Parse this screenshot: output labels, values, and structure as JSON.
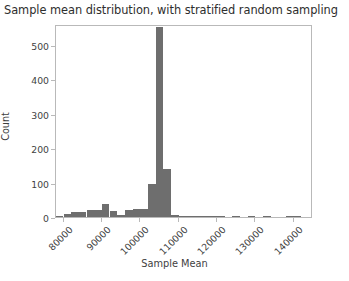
{
  "chart_data": {
    "type": "bar",
    "title": "Sample mean distribution, with stratified random sampling",
    "xlabel": "Sample Mean",
    "ylabel": "Count",
    "xlim": [
      78000,
      145000
    ],
    "ylim": [
      0,
      560
    ],
    "grid": false,
    "legend": null,
    "bar_color": "#6e6e6e",
    "bin_width": 2000,
    "xticks": [
      80000,
      90000,
      100000,
      110000,
      120000,
      130000,
      140000
    ],
    "xtick_labels": [
      "80000",
      "90000",
      "100000",
      "110000",
      "120000",
      "130000",
      "140000"
    ],
    "yticks": [
      0,
      100,
      200,
      300,
      400,
      500
    ],
    "ytick_labels": [
      "0",
      "100",
      "200",
      "300",
      "400",
      "500"
    ],
    "bins": [
      {
        "x": 78000,
        "value": 4
      },
      {
        "x": 80000,
        "value": 9
      },
      {
        "x": 82000,
        "value": 14
      },
      {
        "x": 84000,
        "value": 14
      },
      {
        "x": 86000,
        "value": 20
      },
      {
        "x": 88000,
        "value": 20
      },
      {
        "x": 90000,
        "value": 38
      },
      {
        "x": 92000,
        "value": 18
      },
      {
        "x": 94000,
        "value": 7
      },
      {
        "x": 96000,
        "value": 20
      },
      {
        "x": 98000,
        "value": 22
      },
      {
        "x": 100000,
        "value": 22
      },
      {
        "x": 102000,
        "value": 95
      },
      {
        "x": 104000,
        "value": 550
      },
      {
        "x": 106000,
        "value": 140
      },
      {
        "x": 108000,
        "value": 5
      },
      {
        "x": 110000,
        "value": 3
      },
      {
        "x": 112000,
        "value": 2
      },
      {
        "x": 114000,
        "value": 1
      },
      {
        "x": 116000,
        "value": 2
      },
      {
        "x": 118000,
        "value": 1
      },
      {
        "x": 120000,
        "value": 1
      },
      {
        "x": 122000,
        "value": 0
      },
      {
        "x": 124000,
        "value": 1
      },
      {
        "x": 126000,
        "value": 0
      },
      {
        "x": 128000,
        "value": 1
      },
      {
        "x": 130000,
        "value": 0
      },
      {
        "x": 132000,
        "value": 1
      },
      {
        "x": 134000,
        "value": 0
      },
      {
        "x": 136000,
        "value": 0
      },
      {
        "x": 138000,
        "value": 1
      },
      {
        "x": 140000,
        "value": 1
      },
      {
        "x": 142000,
        "value": 0
      }
    ]
  }
}
